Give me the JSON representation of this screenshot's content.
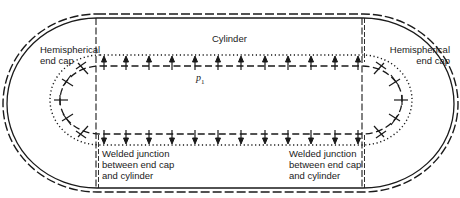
{
  "diagram": {
    "labels": {
      "cylinder": "Cylinder",
      "left_cap": [
        "Hemispherical",
        "end cap"
      ],
      "right_cap": [
        "Hemispherical",
        "end cap"
      ],
      "left_weld": [
        "Welded junction",
        "between end cap",
        "and cylinder"
      ],
      "right_weld": [
        "Welded junction",
        "between end cap",
        "and cylinder"
      ],
      "pressure_symbol": "p",
      "pressure_subscript": "1"
    },
    "colors": {
      "stroke": "#1a1a1a",
      "background": "#ffffff"
    },
    "geometry": {
      "outer_shell": {
        "x1": 52,
        "x2": 410,
        "top": 16,
        "bottom": 186,
        "style": "double line, outer dashed / inner solid"
      },
      "inner_surface": {
        "x1": 100,
        "x2": 362,
        "top": 63,
        "bottom": 133,
        "style": "dashed (pre-deformation) with dotted deformed outline"
      },
      "junction_x": [
        97,
        363
      ],
      "internal_pressure_arrows": {
        "top_count": 11,
        "bottom_count": 11,
        "left_cap_count": 5,
        "right_cap_count": 5,
        "direction": "outward"
      }
    }
  }
}
